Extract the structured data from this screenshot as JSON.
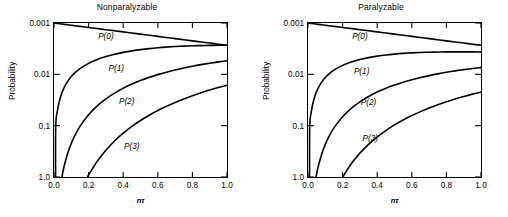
{
  "figure": {
    "background": "#ffffff",
    "line_color": "#000000",
    "width": 508,
    "height": 217
  },
  "panels": [
    {
      "id": "nonparalyzable",
      "title": "Nonparalyzable",
      "ylabel": "Probability",
      "xlabel": "nτ",
      "xticks": [
        "0.0",
        "0.2",
        "0.4",
        "0.6",
        "0.8",
        "1.0"
      ],
      "yticks": [
        "1.0",
        "0.1",
        "0.01",
        "0.001"
      ],
      "curve_labels": [
        {
          "text": "P(0)",
          "x": 0.3,
          "y": 0.55
        },
        {
          "text": "P(1)",
          "x": 0.36,
          "y": 0.135
        },
        {
          "text": "P(2)",
          "x": 0.42,
          "y": 0.03
        },
        {
          "text": "P(3)",
          "x": 0.45,
          "y": 0.004
        }
      ]
    },
    {
      "id": "paralyzable",
      "title": "Paralyzable",
      "ylabel": "Probability",
      "xlabel": "nτ",
      "xticks": [
        "0.0",
        "0.2",
        "0.4",
        "0.6",
        "0.8",
        "1.0"
      ],
      "yticks": [
        "1.0",
        "0.1",
        "0.01",
        "0.001"
      ],
      "curve_labels": [
        {
          "text": "P(0)",
          "x": 0.3,
          "y": 0.56
        },
        {
          "text": "P(1)",
          "x": 0.31,
          "y": 0.115
        },
        {
          "text": "P(2)",
          "x": 0.35,
          "y": 0.0295
        },
        {
          "text": "P(3)",
          "x": 0.36,
          "y": 0.0058
        }
      ]
    }
  ],
  "chart_data": [
    {
      "type": "line",
      "title": "Nonparalyzable",
      "xlabel": "nτ",
      "ylabel": "Probability",
      "xlim": [
        0.0,
        1.0
      ],
      "ylim": [
        0.001,
        1.0
      ],
      "yscale": "log",
      "xscale": "linear",
      "grid": false,
      "legend": "inline-curve-labels",
      "xticks": [
        0.0,
        0.2,
        0.4,
        0.6,
        0.8,
        1.0
      ],
      "yticks": [
        0.001,
        0.01,
        0.1,
        1.0
      ],
      "x": [
        0.0,
        0.01,
        0.02,
        0.03,
        0.04,
        0.05,
        0.06,
        0.08,
        0.1,
        0.12,
        0.15,
        0.2,
        0.25,
        0.3,
        0.35,
        0.4,
        0.45,
        0.5,
        0.55,
        0.6,
        0.65,
        0.7,
        0.75,
        0.8,
        0.85,
        0.9,
        0.95,
        1.0
      ],
      "series": [
        {
          "name": "P(0)",
          "values": [
            1.0,
            0.99005,
            0.9802,
            0.97045,
            0.96079,
            0.95123,
            0.94176,
            0.92312,
            0.90484,
            0.88692,
            0.86071,
            0.81873,
            0.7788,
            0.74082,
            0.70469,
            0.67032,
            0.63763,
            0.60653,
            0.57695,
            0.54881,
            0.52205,
            0.49659,
            0.47237,
            0.44933,
            0.42741,
            0.40657,
            0.38674,
            0.36788
          ]
        },
        {
          "name": "P(1)",
          "values": [
            0.0,
            0.0099,
            0.0196,
            0.02911,
            0.03843,
            0.04756,
            0.05651,
            0.07385,
            0.09048,
            0.10643,
            0.12911,
            0.16375,
            0.1947,
            0.22225,
            0.24664,
            0.26813,
            0.28693,
            0.30327,
            0.31732,
            0.32929,
            0.33933,
            0.34761,
            0.35428,
            0.35946,
            0.3633,
            0.36591,
            0.3674,
            0.36788
          ]
        },
        {
          "name": "P(2)",
          "values": [
            0.0,
            4.95e-05,
            0.000196,
            0.000437,
            0.000769,
            0.001189,
            0.001695,
            0.002954,
            0.004524,
            0.006386,
            0.009683,
            0.016375,
            0.024338,
            0.033337,
            0.043162,
            0.053626,
            0.064559,
            0.075816,
            0.087263,
            0.098786,
            0.110282,
            0.121663,
            0.132856,
            0.143785,
            0.154403,
            0.16466,
            0.174516,
            0.18394
          ]
        },
        {
          "name": "P(3)",
          "values": [
            0.0,
            1.65e-07,
            1.31e-06,
            4.37e-06,
            1.025e-05,
            1.98e-05,
            3.39e-05,
            7.88e-05,
            0.000151,
            0.000255,
            0.000484,
            0.001092,
            0.002028,
            0.003334,
            0.005036,
            0.00715,
            0.009684,
            0.012636,
            0.016,
            0.019757,
            0.023894,
            0.028388,
            0.033214,
            0.038343,
            0.043748,
            0.049398,
            0.055263,
            0.061313
          ]
        }
      ]
    },
    {
      "type": "line",
      "title": "Paralyzable",
      "xlabel": "nτ",
      "ylabel": "Probability",
      "xlim": [
        0.0,
        1.0
      ],
      "ylim": [
        0.001,
        1.0
      ],
      "yscale": "log",
      "xscale": "linear",
      "grid": false,
      "legend": "inline-curve-labels",
      "xticks": [
        0.0,
        0.2,
        0.4,
        0.6,
        0.8,
        1.0
      ],
      "yticks": [
        0.001,
        0.01,
        0.1,
        1.0
      ],
      "x": [
        0.0,
        0.01,
        0.02,
        0.03,
        0.04,
        0.05,
        0.06,
        0.08,
        0.1,
        0.12,
        0.15,
        0.2,
        0.25,
        0.3,
        0.35,
        0.4,
        0.45,
        0.5,
        0.55,
        0.6,
        0.65,
        0.7,
        0.75,
        0.8,
        0.85,
        0.9,
        0.95,
        1.0
      ],
      "series": [
        {
          "name": "P(0)",
          "values": [
            1.0,
            0.99005,
            0.9802,
            0.97045,
            0.96079,
            0.95123,
            0.94176,
            0.92312,
            0.90484,
            0.88692,
            0.86071,
            0.81873,
            0.7788,
            0.74082,
            0.70469,
            0.67032,
            0.63763,
            0.60653,
            0.57695,
            0.54881,
            0.52205,
            0.49659,
            0.47237,
            0.44933,
            0.42741,
            0.40657,
            0.38674,
            0.36788
          ]
        },
        {
          "name": "P(1)",
          "values": [
            0.0,
            0.00985,
            0.01942,
            0.0287,
            0.03771,
            0.04646,
            0.05494,
            0.07116,
            0.08644,
            0.10081,
            0.12066,
            0.14936,
            0.17377,
            0.19443,
            0.2118,
            0.22628,
            0.23823,
            0.24797,
            0.25577,
            0.26189,
            0.26656,
            0.26997,
            0.27231,
            0.27373,
            0.27438,
            0.27438,
            0.27385,
            0.27067
          ]
        },
        {
          "name": "P(2)",
          "values": [
            0.0,
            4.93e-05,
            0.000194,
            0.00043,
            0.000754,
            0.001161,
            0.001648,
            0.002846,
            0.004322,
            0.006049,
            0.009049,
            0.014936,
            0.021721,
            0.029165,
            0.037065,
            0.045256,
            0.053602,
            0.061993,
            0.070337,
            0.078566,
            0.086632,
            0.094489,
            0.102117,
            0.109492,
            0.11661,
            0.123471,
            0.130078,
            0.135335
          ]
        },
        {
          "name": "P(3)",
          "values": [
            0.0,
            1.64e-07,
            1.29e-06,
            4.3e-06,
            1.005e-05,
            1.94e-05,
            3.3e-05,
            7.59e-05,
            0.000144,
            0.000242,
            0.000452,
            0.000996,
            0.00181,
            0.002917,
            0.004324,
            0.006034,
            0.00804,
            0.010332,
            0.012895,
            0.015713,
            0.01877,
            0.022047,
            0.025529,
            0.029198,
            0.03304,
            0.037041,
            0.041191,
            0.045112
          ]
        }
      ]
    }
  ]
}
